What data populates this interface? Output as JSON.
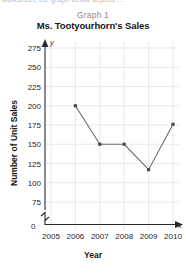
{
  "clipped_header_text": "worksheet, the graph below depicts ...",
  "figure": {
    "graph_number": "Graph 1",
    "title": "Ms. Tootyourhorn's Sales",
    "origin_label": "0",
    "y_axis_letter": "y",
    "x_axis_letter": "x"
  },
  "colors": {
    "line": "#6b6b6b",
    "marker": "#4a4a4a",
    "axis": "#2a2a2a",
    "grid": "#e9e9e9",
    "title": "#161616",
    "graph_number": "#8d8d8d"
  },
  "chart_data": {
    "type": "line",
    "title": "Ms. Tootyourhorn's Sales",
    "subtitle": "Graph 1",
    "xlabel": "Year",
    "ylabel": "Number of Unit Sales",
    "x": [
      2006,
      2007,
      2008,
      2009,
      2010
    ],
    "values": [
      200,
      150,
      150,
      117,
      176
    ],
    "series": [
      {
        "name": "Ms. Tootyourhorn's Sales",
        "values": [
          200,
          150,
          150,
          117,
          176
        ]
      }
    ],
    "x_tick_labels": [
      "2005",
      "2006",
      "2007",
      "2008",
      "2009",
      "2010"
    ],
    "x_ticks": [
      2005,
      2006,
      2007,
      2008,
      2009,
      2010
    ],
    "y_tick_labels": [
      "0",
      "75",
      "100",
      "125",
      "150",
      "175",
      "200",
      "225",
      "250",
      "275"
    ],
    "y_ticks": [
      0,
      75,
      100,
      125,
      150,
      175,
      200,
      225,
      250,
      275
    ],
    "xlim": [
      2005,
      2010
    ],
    "ylim": [
      75,
      275
    ],
    "y_axis_break": true,
    "grid": true,
    "legend": "none",
    "markers": "square"
  }
}
